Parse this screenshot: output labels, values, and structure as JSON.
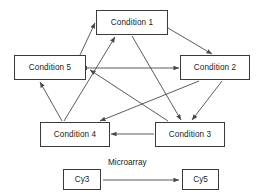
{
  "diagram": {
    "type": "directed-graph",
    "line_color": "#4a4a4a",
    "box_border_color": "#3a3a3a",
    "background": "#ffffff",
    "nodes": [
      {
        "id": "c1",
        "label": "Condition 1"
      },
      {
        "id": "c2",
        "label": "Condition 2"
      },
      {
        "id": "c3",
        "label": "Condition 3"
      },
      {
        "id": "c4",
        "label": "Condition 4"
      },
      {
        "id": "c5",
        "label": "Condition 5"
      }
    ],
    "edges": [
      {
        "from": "c5",
        "to": "c1",
        "direction": "single"
      },
      {
        "from": "c1",
        "to": "c2",
        "direction": "single"
      },
      {
        "from": "c5",
        "to": "c2",
        "direction": "double"
      },
      {
        "from": "c3",
        "to": "c4",
        "direction": "single"
      },
      {
        "from": "c4",
        "to": "c5",
        "direction": "single"
      },
      {
        "from": "c4",
        "to": "c1",
        "direction": "single"
      },
      {
        "from": "c2",
        "to": "c4",
        "direction": "single"
      },
      {
        "from": "c1",
        "to": "c3",
        "direction": "single"
      },
      {
        "from": "c2",
        "to": "c3",
        "direction": "single"
      },
      {
        "from": "c3",
        "to": "c5",
        "direction": "single"
      }
    ]
  },
  "legend": {
    "source_label": "Cy3",
    "target_label": "Cy5",
    "edge_label": "Microarray"
  }
}
